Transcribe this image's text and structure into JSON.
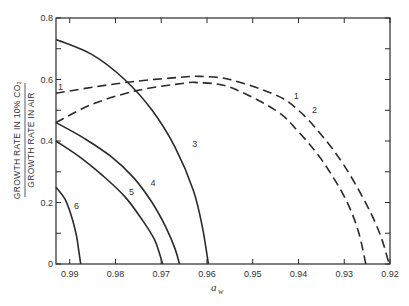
{
  "chart_data": {
    "type": "line",
    "title": "",
    "xlabel": "a_w",
    "ylabel": "GROWTH RATE IN 10% CO2 / GROWTH RATE IN AIR",
    "ylabel_numerator": "GROWTH RATE IN 10% CO₂",
    "ylabel_denominator": "GROWTH RATE IN AIR",
    "xlim": [
      0.993,
      0.92
    ],
    "ylim": [
      0,
      0.8
    ],
    "x_ticks": [
      "0.99",
      "0.98",
      "0.97",
      "0.96",
      "0.95",
      "0.94",
      "0.93",
      "0.92"
    ],
    "y_ticks": [
      "0",
      "0.2",
      "0.4",
      "0.6",
      "0.8"
    ],
    "grid": false,
    "legend": "inline curve labels",
    "series": [
      {
        "name": "1",
        "style": "dashed",
        "x": [
          0.993,
          0.985,
          0.975,
          0.965,
          0.9615,
          0.955,
          0.945,
          0.94,
          0.935,
          0.93,
          0.925,
          0.922,
          0.9202
        ],
        "y": [
          0.555,
          0.575,
          0.595,
          0.608,
          0.61,
          0.6,
          0.55,
          0.5,
          0.42,
          0.32,
          0.19,
          0.09,
          0.0
        ]
      },
      {
        "name": "2",
        "style": "dashed",
        "x": [
          0.993,
          0.985,
          0.975,
          0.965,
          0.962,
          0.955,
          0.945,
          0.94,
          0.935,
          0.93,
          0.927,
          0.9253
        ],
        "y": [
          0.46,
          0.52,
          0.565,
          0.588,
          0.59,
          0.575,
          0.5,
          0.43,
          0.34,
          0.22,
          0.11,
          0.0
        ]
      },
      {
        "name": "3",
        "style": "solid",
        "x": [
          0.993,
          0.985,
          0.978,
          0.972,
          0.967,
          0.963,
          0.961,
          0.9597
        ],
        "y": [
          0.73,
          0.68,
          0.6,
          0.5,
          0.38,
          0.24,
          0.12,
          0.0
        ]
      },
      {
        "name": "4",
        "style": "solid",
        "x": [
          0.993,
          0.987,
          0.981,
          0.976,
          0.972,
          0.969,
          0.967,
          0.966
        ],
        "y": [
          0.46,
          0.41,
          0.35,
          0.28,
          0.2,
          0.12,
          0.05,
          0.0
        ]
      },
      {
        "name": "5",
        "style": "solid",
        "x": [
          0.993,
          0.988,
          0.983,
          0.978,
          0.974,
          0.9715,
          0.9703,
          0.9697
        ],
        "y": [
          0.4,
          0.35,
          0.29,
          0.22,
          0.14,
          0.08,
          0.03,
          0.0
        ]
      },
      {
        "name": "6",
        "style": "solid",
        "x": [
          0.993,
          0.991,
          0.9895,
          0.9885,
          0.988,
          0.9876
        ],
        "y": [
          0.25,
          0.21,
          0.15,
          0.09,
          0.04,
          0.0
        ]
      }
    ],
    "annotations": [
      {
        "text": "1",
        "x": 0.9405,
        "y": 0.535
      },
      {
        "text": "2",
        "x": 0.9365,
        "y": 0.49
      },
      {
        "text": "3",
        "x": 0.9627,
        "y": 0.38
      },
      {
        "text": "4",
        "x": 0.9718,
        "y": 0.255
      },
      {
        "text": "5",
        "x": 0.9765,
        "y": 0.225
      },
      {
        "text": "6",
        "x": 0.9885,
        "y": 0.18
      },
      {
        "text": "1",
        "x": 0.992,
        "y": 0.565
      }
    ]
  }
}
